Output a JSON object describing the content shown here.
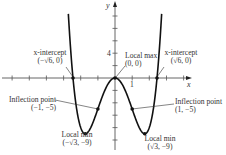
{
  "chart_data": {
    "type": "line",
    "function": "f(x) = x^4 - 6x^2",
    "xlabel": "x",
    "ylabel": "y",
    "tick_labels": {
      "x": [
        "1"
      ],
      "y": [
        "4"
      ]
    },
    "xlim": [
      -3.3,
      4.4
    ],
    "ylim": [
      -10,
      12.5
    ],
    "grid": false,
    "annotations": [
      {
        "label": "x-intercept",
        "point": "(−√6, 0)",
        "x": -2.449,
        "y": 0
      },
      {
        "label": "Local max",
        "point": "(0, 0)",
        "x": 0,
        "y": 0
      },
      {
        "label": "x-intercept",
        "point": "(√6, 0)",
        "x": 2.449,
        "y": 0
      },
      {
        "label": "Inflection point",
        "point": "(−1, −5)",
        "x": -1,
        "y": -5
      },
      {
        "label": "Inflection point",
        "point": "(1, −5)",
        "x": 1,
        "y": -5
      },
      {
        "label": "Local min",
        "point": "(−√3, −9)",
        "x": -1.732,
        "y": -9
      },
      {
        "label": "Local min",
        "point": "(√3, −9)",
        "x": 1.732,
        "y": -9
      }
    ]
  },
  "labels": {
    "y_axis": "y",
    "x_axis": "x",
    "tick_y4": "4",
    "tick_x1": "1",
    "xint_left_title": "x-intercept",
    "xint_left_point": "(−√6, 0)",
    "xint_right_title": "x-intercept",
    "xint_right_point": "(√6, 0)",
    "localmax_title": "Local max",
    "localmax_point": "(0, 0)",
    "infl_left_title": "Inflection point",
    "infl_left_point": "(−1, −5)",
    "infl_right_title": "Inflection point",
    "infl_right_point": "(1, −5)",
    "min_left_title": "Local min",
    "min_left_point": "(−√3, −9)",
    "min_right_title": "Local min",
    "min_right_point": "(√3, −9)"
  }
}
